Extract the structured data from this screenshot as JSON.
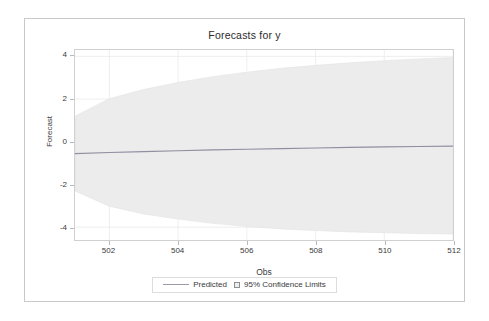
{
  "chart_data": {
    "type": "area",
    "title": "Forecasts for y",
    "xlabel": "Obs",
    "ylabel": "Forecast",
    "xlim": [
      501,
      512
    ],
    "ylim": [
      -4.6,
      4.3
    ],
    "xticks": [
      502,
      504,
      506,
      508,
      510,
      512
    ],
    "yticks": [
      -4,
      -2,
      0,
      2,
      4
    ],
    "grid": true,
    "legend_position": "bottom",
    "series": [
      {
        "name": "Predicted",
        "type": "line",
        "x": [
          501,
          502,
          503,
          504,
          505,
          506,
          507,
          508,
          509,
          510,
          511,
          512
        ],
        "values": [
          -0.55,
          -0.5,
          -0.46,
          -0.42,
          -0.38,
          -0.35,
          -0.32,
          -0.29,
          -0.26,
          -0.24,
          -0.22,
          -0.2
        ]
      },
      {
        "name": "95% Confidence Limits",
        "type": "band",
        "x": [
          501,
          502,
          503,
          504,
          505,
          506,
          507,
          508,
          509,
          510,
          511,
          512
        ],
        "upper": [
          1.2,
          2.02,
          2.45,
          2.78,
          3.05,
          3.26,
          3.44,
          3.58,
          3.7,
          3.8,
          3.88,
          3.95
        ],
        "lower": [
          -2.3,
          -3.02,
          -3.38,
          -3.62,
          -3.82,
          -3.96,
          -4.08,
          -4.16,
          -4.22,
          -4.26,
          -4.3,
          -4.32
        ]
      }
    ],
    "colors": {
      "band_fill": "#ececec",
      "band_edge": "#e2e2e2",
      "predicted_line": "#8f8fa0",
      "grid": "#eaeaea",
      "axis": "#d0d0d0",
      "text": "#3a3a3a",
      "card_border": "#c9c9c9",
      "background": "#ffffff"
    }
  },
  "legend": {
    "entries": [
      {
        "label": "Predicted",
        "marker": "line-swatch"
      },
      {
        "label": "95% Confidence Limits",
        "marker": "box-swatch"
      }
    ]
  },
  "axes": {
    "y_tick_labels": [
      "4",
      "2",
      "0",
      "-2",
      "-4"
    ],
    "x_tick_labels": [
      "502",
      "504",
      "506",
      "508",
      "510",
      "512"
    ]
  }
}
